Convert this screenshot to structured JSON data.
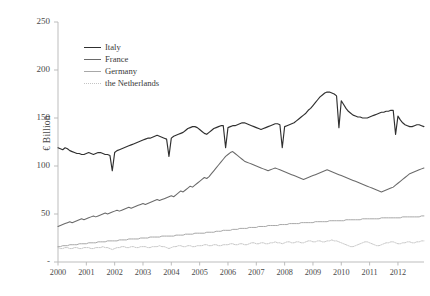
{
  "chart_data": {
    "type": "line",
    "title": "",
    "xlabel": "",
    "ylabel": "€ Billion",
    "xlim": [
      2000,
      2012.92
    ],
    "ylim": [
      0,
      250
    ],
    "grid": false,
    "legend_position": "top-left-inside",
    "y_ticks": [
      0,
      50,
      100,
      150,
      200,
      250
    ],
    "y_tick_labels": [
      "-",
      "50",
      "100",
      "150",
      "200",
      "250"
    ],
    "x_ticks": [
      2000,
      2001,
      2002,
      2003,
      2004,
      2005,
      2006,
      2007,
      2008,
      2009,
      2010,
      2011,
      2012
    ],
    "x_tick_labels": [
      "2000",
      "2001",
      "2002",
      "2003",
      "2004",
      "2005",
      "2006",
      "2007",
      "2008",
      "2009",
      "2010",
      "2011",
      "2012"
    ],
    "series": [
      {
        "name": "Italy",
        "color": "#303030",
        "width": 1.15,
        "dash": "none",
        "x_start": 2000.0,
        "x_step": 0.0833333,
        "values": [
          119,
          118,
          117,
          119,
          118,
          116,
          115,
          114,
          113,
          113,
          112,
          112,
          113,
          114,
          113,
          112,
          113,
          114,
          114,
          113,
          112,
          112,
          111,
          95,
          114,
          116,
          117,
          118,
          119,
          120,
          121,
          122,
          123,
          124,
          125,
          126,
          127,
          128,
          129,
          129,
          130,
          131,
          132,
          131,
          130,
          129,
          128,
          110,
          129,
          131,
          132,
          133,
          134,
          135,
          137,
          139,
          140,
          141,
          141,
          140,
          138,
          136,
          134,
          133,
          135,
          137,
          139,
          140,
          141,
          142,
          142,
          119,
          140,
          141,
          142,
          142,
          143,
          144,
          145,
          145,
          144,
          143,
          142,
          141,
          140,
          139,
          138,
          139,
          140,
          141,
          142,
          143,
          144,
          144,
          143,
          119,
          141,
          142,
          143,
          144,
          145,
          147,
          149,
          151,
          153,
          155,
          158,
          160,
          163,
          166,
          169,
          172,
          174,
          176,
          177,
          177,
          176,
          175,
          173,
          140,
          168,
          164,
          160,
          157,
          155,
          153,
          152,
          151,
          151,
          150,
          150,
          150,
          151,
          152,
          153,
          154,
          155,
          156,
          156,
          157,
          157,
          158,
          158,
          133,
          152,
          148,
          145,
          143,
          142,
          141,
          141,
          142,
          143,
          143,
          142,
          141,
          140,
          139,
          138,
          137,
          137,
          138,
          140,
          142,
          143,
          144,
          143,
          120,
          139,
          137,
          136,
          135,
          134,
          133,
          134,
          136,
          139,
          142,
          144,
          146,
          148,
          150,
          153,
          156,
          160,
          164,
          168,
          172,
          175,
          177,
          178,
          177,
          175,
          173,
          170,
          168,
          166,
          164,
          162,
          160,
          158,
          156,
          154,
          152,
          150,
          149,
          148,
          148,
          149,
          150,
          151,
          152,
          152,
          151,
          150,
          125,
          146,
          144,
          143,
          142,
          141,
          141,
          142,
          143,
          145,
          146,
          147,
          147,
          146,
          145,
          144,
          143,
          142,
          141,
          140,
          139,
          138,
          137,
          136,
          122,
          133,
          131,
          130,
          129,
          129,
          130,
          132,
          135,
          139,
          143,
          147,
          150,
          153,
          156,
          158,
          159,
          160,
          160,
          159,
          157,
          155,
          152,
          149,
          126,
          145,
          143,
          142,
          142,
          143,
          145,
          148,
          151,
          154,
          156,
          158,
          159,
          159,
          158,
          157,
          156,
          155,
          155,
          156,
          157,
          158,
          158,
          157,
          156,
          155,
          155,
          156,
          157,
          158,
          158,
          157,
          156,
          156,
          157,
          158,
          158
        ]
      },
      {
        "name": "France",
        "color": "#6a6a6a",
        "width": 1.05,
        "dash": "none",
        "x_start": 2000.0,
        "x_step": 0.0833333,
        "values": [
          37,
          38,
          39,
          40,
          41,
          42,
          41,
          42,
          43,
          44,
          45,
          44,
          45,
          46,
          47,
          48,
          47,
          48,
          49,
          50,
          51,
          50,
          51,
          52,
          53,
          54,
          53,
          54,
          55,
          56,
          57,
          56,
          57,
          58,
          59,
          60,
          61,
          60,
          61,
          62,
          63,
          64,
          65,
          64,
          65,
          66,
          67,
          68,
          69,
          68,
          70,
          72,
          74,
          73,
          75,
          77,
          79,
          78,
          80,
          82,
          84,
          86,
          88,
          87,
          89,
          92,
          95,
          98,
          101,
          104,
          107,
          110,
          112,
          114,
          115,
          113,
          111,
          109,
          107,
          105,
          104,
          103,
          102,
          101,
          100,
          99,
          98,
          97,
          96,
          95,
          96,
          97,
          98,
          97,
          96,
          95,
          94,
          93,
          92,
          91,
          90,
          89,
          88,
          87,
          86,
          87,
          88,
          89,
          90,
          91,
          92,
          93,
          94,
          95,
          96,
          95,
          94,
          93,
          92,
          91,
          90,
          89,
          88,
          87,
          86,
          85,
          84,
          83,
          82,
          81,
          80,
          79,
          78,
          77,
          76,
          75,
          74,
          73,
          74,
          75,
          76,
          77,
          78,
          80,
          82,
          84,
          86,
          88,
          90,
          92,
          93,
          94,
          95,
          96,
          97,
          98,
          99,
          100,
          101,
          103,
          105,
          107,
          109,
          111,
          113,
          115,
          117,
          119,
          121,
          123,
          125,
          127,
          129,
          131,
          133,
          136,
          140,
          145,
          150,
          156,
          162,
          168,
          174,
          180,
          187,
          194,
          200,
          206,
          211,
          215,
          218,
          220,
          222,
          223,
          222,
          220,
          217,
          214,
          212,
          211,
          212,
          213,
          213,
          212,
          211,
          210,
          210,
          211,
          212,
          213,
          212,
          211,
          210,
          209,
          208,
          207,
          206,
          205,
          204,
          203,
          202,
          201,
          200,
          199,
          197,
          195,
          193,
          191,
          189,
          186,
          183,
          180,
          177,
          174,
          171,
          168,
          165,
          163,
          161,
          160,
          159,
          160,
          162,
          164,
          167,
          170,
          173,
          176,
          178,
          180,
          182,
          183,
          184,
          184,
          183,
          181,
          179,
          177,
          175,
          173,
          171,
          169,
          167,
          166,
          165,
          164,
          163,
          162,
          161,
          160,
          161,
          163,
          165,
          167,
          170,
          172,
          174,
          176,
          177,
          178,
          178,
          177,
          176,
          175,
          174,
          173,
          172,
          172,
          173,
          174,
          175,
          176,
          177,
          178,
          179,
          180,
          181,
          181,
          180,
          180
        ]
      },
      {
        "name": "Germany",
        "color": "#a8a8a8",
        "width": 1.0,
        "dash": "none",
        "x_start": 2000.0,
        "x_step": 0.0833333,
        "values": [
          16,
          16,
          17,
          17,
          17,
          18,
          18,
          18,
          18,
          19,
          19,
          19,
          19,
          20,
          20,
          20,
          20,
          21,
          21,
          21,
          21,
          22,
          22,
          22,
          22,
          22,
          23,
          23,
          23,
          23,
          24,
          24,
          24,
          24,
          24,
          25,
          25,
          25,
          25,
          26,
          26,
          26,
          26,
          26,
          27,
          27,
          27,
          27,
          27,
          27,
          28,
          28,
          28,
          28,
          29,
          29,
          29,
          29,
          30,
          30,
          30,
          30,
          30,
          31,
          31,
          31,
          31,
          32,
          32,
          32,
          33,
          33,
          33,
          33,
          34,
          34,
          34,
          35,
          35,
          35,
          35,
          36,
          36,
          36,
          36,
          37,
          37,
          37,
          37,
          38,
          38,
          38,
          38,
          38,
          39,
          39,
          39,
          39,
          40,
          40,
          40,
          40,
          40,
          41,
          41,
          41,
          41,
          41,
          41,
          42,
          42,
          42,
          42,
          42,
          42,
          43,
          43,
          43,
          43,
          43,
          43,
          43,
          44,
          44,
          44,
          44,
          44,
          44,
          44,
          45,
          45,
          45,
          45,
          45,
          45,
          45,
          45,
          46,
          46,
          46,
          46,
          46,
          46,
          46,
          46,
          46,
          47,
          47,
          47,
          47,
          47,
          47,
          47,
          47,
          48,
          48,
          48,
          48,
          48,
          48,
          48,
          48,
          48,
          49,
          49,
          49,
          50,
          52,
          56,
          62,
          70,
          80,
          92,
          103,
          112,
          118,
          122,
          124,
          125,
          124,
          122,
          119,
          115,
          112,
          110,
          110,
          111,
          112,
          114,
          116,
          118,
          121,
          125,
          130,
          136,
          144,
          154,
          166,
          180,
          196,
          212,
          226,
          238,
          245,
          243,
          230,
          210,
          185,
          160,
          138,
          122,
          112,
          105,
          100,
          96,
          93,
          91,
          90,
          90,
          91,
          93,
          96,
          99,
          103,
          107,
          110,
          112,
          113,
          113,
          112,
          110,
          107,
          104,
          100,
          96,
          92,
          88,
          85,
          82,
          80,
          79,
          78,
          78,
          78,
          78,
          78,
          78,
          77,
          77,
          76,
          76,
          75,
          75,
          74,
          74,
          73,
          73,
          72,
          72,
          72,
          71,
          71,
          71,
          70,
          70,
          70,
          70,
          69,
          69,
          69,
          69,
          69,
          69,
          68,
          68,
          68,
          68,
          68,
          68,
          68,
          68,
          68,
          68,
          68,
          68,
          68,
          68,
          68,
          68,
          68,
          68,
          68,
          68,
          68,
          68,
          68,
          68,
          68,
          68,
          68
        ]
      },
      {
        "name": "the Netherlands",
        "color": "#c4c4c4",
        "width": 0.95,
        "dash": "1.4,1.1",
        "x_start": 2000.0,
        "x_step": 0.0833333,
        "values": [
          15,
          14,
          14,
          15,
          15,
          14,
          14,
          15,
          15,
          14,
          14,
          15,
          15,
          15,
          14,
          14,
          15,
          15,
          15,
          16,
          15,
          15,
          14,
          13,
          14,
          15,
          15,
          16,
          16,
          15,
          15,
          16,
          16,
          15,
          15,
          16,
          16,
          16,
          15,
          15,
          16,
          16,
          16,
          17,
          16,
          16,
          15,
          14,
          15,
          16,
          16,
          17,
          17,
          16,
          16,
          17,
          17,
          16,
          16,
          17,
          17,
          17,
          18,
          18,
          17,
          17,
          18,
          18,
          17,
          17,
          18,
          18,
          18,
          19,
          19,
          18,
          18,
          19,
          19,
          18,
          18,
          19,
          20,
          20,
          19,
          19,
          20,
          20,
          19,
          19,
          20,
          20,
          21,
          20,
          20,
          19,
          20,
          21,
          21,
          20,
          20,
          21,
          21,
          20,
          20,
          21,
          22,
          22,
          21,
          21,
          22,
          22,
          21,
          21,
          22,
          22,
          23,
          22,
          22,
          21,
          20,
          19,
          18,
          17,
          16,
          16,
          17,
          18,
          19,
          20,
          21,
          21,
          20,
          19,
          18,
          17,
          17,
          18,
          19,
          20,
          20,
          21,
          21,
          20,
          19,
          19,
          20,
          20,
          21,
          21,
          20,
          20,
          21,
          21,
          22,
          22,
          21,
          21,
          22,
          22,
          21,
          21,
          22,
          22,
          21,
          21,
          22,
          22,
          21,
          21,
          22,
          22,
          22,
          22,
          22,
          22,
          23,
          23,
          23,
          23,
          23,
          23,
          23,
          23,
          23,
          23,
          23,
          23,
          23,
          23,
          23,
          23,
          23,
          24,
          26,
          30,
          36,
          44,
          52,
          58,
          61,
          59,
          55,
          52,
          50,
          49,
          50,
          52,
          54,
          55,
          54,
          53,
          52,
          51,
          52,
          53,
          54,
          53,
          52,
          51,
          50,
          49,
          50,
          51,
          52,
          51,
          50,
          49,
          48,
          47,
          46,
          47,
          48,
          49,
          50,
          51,
          52,
          51,
          50,
          49,
          48,
          49,
          50,
          51,
          52,
          53,
          53,
          52,
          51,
          50,
          49,
          48,
          47,
          46,
          45,
          46,
          47,
          48,
          49,
          50,
          49,
          48,
          47,
          46,
          45,
          44,
          43,
          42,
          41,
          40,
          39,
          38,
          37,
          36,
          35,
          34,
          33,
          32,
          31,
          30,
          30,
          29,
          28,
          27,
          27,
          26,
          26,
          25,
          25,
          25,
          24,
          24,
          24,
          25,
          25,
          26,
          26,
          25,
          25,
          25
        ]
      }
    ]
  },
  "legend": {
    "items": [
      {
        "label": "Italy"
      },
      {
        "label": "France"
      },
      {
        "label": "Germany"
      },
      {
        "label": "the Netherlands"
      }
    ]
  },
  "axes": {
    "y_axis_label": "€ Billion"
  }
}
